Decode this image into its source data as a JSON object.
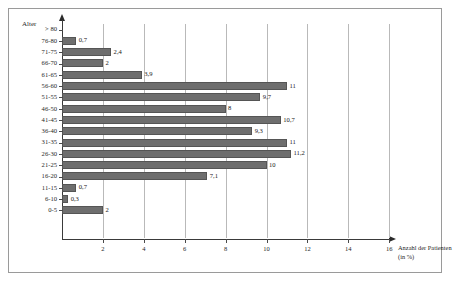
{
  "chart_data": {
    "type": "bar",
    "orientation": "horizontal",
    "title": "",
    "xlabel": "Anzahl der Patienten (in %)",
    "ylabel": "Alter",
    "xlim": [
      0,
      17
    ],
    "xticks": [
      2,
      4,
      6,
      8,
      10,
      12,
      14,
      16
    ],
    "grid": true,
    "legend": null,
    "bar_color": "#6e6e6e",
    "categories": [
      "> 80",
      "76-80",
      "71-75",
      "66-70",
      "61-65",
      "56-60",
      "51-55",
      "46-50",
      "41-45",
      "36-40",
      "31-35",
      "26-30",
      "21-25",
      "16-20",
      "11-15",
      "6-10",
      "0-5"
    ],
    "values": [
      0,
      0.7,
      2.4,
      2,
      3.9,
      11,
      9.7,
      8,
      10.7,
      9.3,
      11,
      11.2,
      10,
      7.1,
      0.7,
      0.3,
      2
    ],
    "value_labels": [
      "",
      "0,7",
      "2,4",
      "2",
      "3,9",
      "11",
      "9,7",
      "8",
      "10,7",
      "9,3",
      "11",
      "11,2",
      "10",
      "7,1",
      "0,7",
      "0,3",
      "2"
    ]
  }
}
